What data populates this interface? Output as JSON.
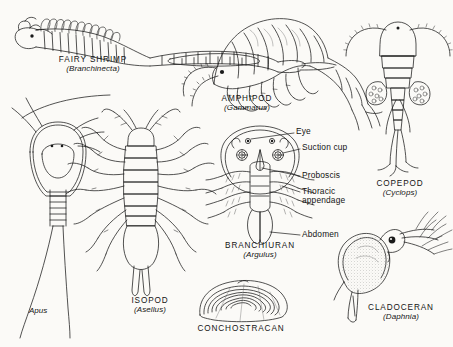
{
  "plate": {
    "title": "Freshwater Crustacea plate",
    "background_color": "#fbfaf7",
    "ink_color": "#1a1a1a"
  },
  "figures": [
    {
      "id": "fairy-shrimp",
      "common_name": "FAIRY  SHRIMP",
      "genus": "(Branchinecta)",
      "group": "Anostraca"
    },
    {
      "id": "amphipod",
      "common_name": "AMPHIPOD",
      "genus": "(Gammarus)",
      "group": "Amphipoda"
    },
    {
      "id": "copepod",
      "common_name": "COPEPOD",
      "genus": "(Cyclops)",
      "group": "Copepoda"
    },
    {
      "id": "apus",
      "common_name": "",
      "genus": "Apus",
      "group": "Notostraca"
    },
    {
      "id": "isopod",
      "common_name": "ISOPOD",
      "genus": "(Asellus)",
      "group": "Isopoda"
    },
    {
      "id": "branchiuran",
      "common_name": "BRANCHIURAN",
      "genus": "(Argulus)",
      "group": "Branchiura"
    },
    {
      "id": "conchostracan",
      "common_name": "CONCHOSTRACAN",
      "genus": "",
      "group": "Conchostraca"
    },
    {
      "id": "cladoceran",
      "common_name": "CLADOCERAN",
      "genus": "(Daphnia)",
      "group": "Cladocera"
    }
  ],
  "callouts": [
    {
      "id": "eye",
      "label": "Eye"
    },
    {
      "id": "suction-cup",
      "label": "Suction  cup"
    },
    {
      "id": "proboscis",
      "label": "Proboscis"
    },
    {
      "id": "thoracic-appendage",
      "label": "Thoracic",
      "label2": "appendage"
    },
    {
      "id": "abdomen",
      "label": "Abdomen"
    }
  ]
}
